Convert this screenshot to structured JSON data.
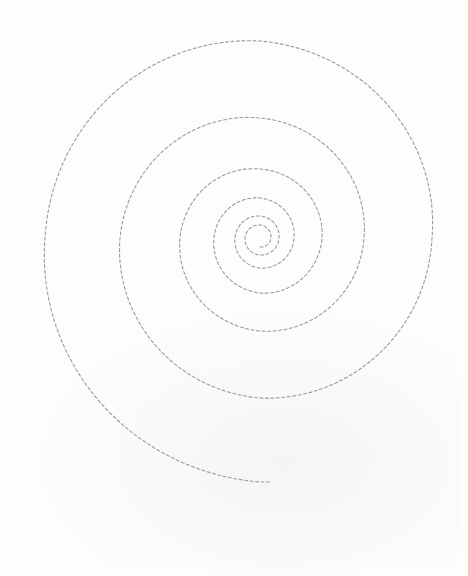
{
  "figure": {
    "background_color": "#fdfdfc",
    "stroke_color": "#9a9a9a",
    "stroke_width": 1.1,
    "dash_pattern": "3 2.5"
  },
  "spiral": {
    "center": [
      260,
      238
    ],
    "samples": [
      [
        0,
        9
      ],
      [
        90,
        11
      ],
      [
        180,
        13
      ],
      [
        270,
        15
      ],
      [
        360,
        17
      ],
      [
        450,
        19
      ],
      [
        540,
        22
      ],
      [
        630,
        25
      ],
      [
        720,
        30
      ],
      [
        810,
        34
      ],
      [
        900,
        40
      ],
      [
        990,
        46
      ],
      [
        1080,
        55
      ],
      [
        1170,
        62
      ],
      [
        1260,
        69
      ],
      [
        1350,
        80
      ],
      [
        1440,
        93
      ],
      [
        1530,
        104
      ],
      [
        1620,
        120
      ],
      [
        1710,
        140
      ],
      [
        1800,
        160
      ],
      [
        1890,
        172
      ],
      [
        1980,
        197
      ],
      [
        2070,
        215
      ],
      [
        2160,
        244
      ]
    ],
    "start_angle_deg": -90,
    "direction": "clockwise-outward",
    "end_point": [
      270,
      482
    ]
  }
}
